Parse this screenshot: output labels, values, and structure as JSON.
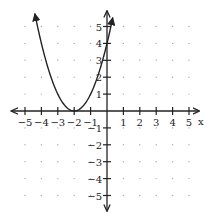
{
  "chart_data": {
    "type": "line",
    "title": "",
    "function": "y = (x + 2)^2",
    "xlabel": "x",
    "ylabel": "",
    "xlim": [
      -5,
      5
    ],
    "ylim": [
      -5,
      5
    ],
    "grid": "dotted",
    "x_ticks": [
      "-5",
      "-4",
      "-3",
      "-2",
      "-1",
      "1",
      "2",
      "3",
      "4",
      "5"
    ],
    "y_ticks": [
      "5",
      "4",
      "3",
      "2",
      "1",
      "-1",
      "-2",
      "-3",
      "-4",
      "-5"
    ],
    "series": [
      {
        "name": "parabola",
        "x": [
          -4.4,
          -4,
          -3,
          -2,
          -1,
          0,
          0.35
        ],
        "y": [
          5.76,
          4,
          1,
          0,
          1,
          4,
          5.52
        ]
      }
    ],
    "vertex": [
      -2,
      0
    ],
    "arrows": "both ends",
    "line_color": "#222222"
  }
}
